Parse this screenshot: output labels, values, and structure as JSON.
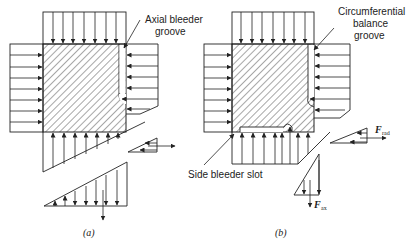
{
  "figure": {
    "panel_a": {
      "caption": "(a)",
      "labels": {
        "groove": [
          "Axial bleeder",
          "groove"
        ]
      }
    },
    "panel_b": {
      "caption": "(b)",
      "labels": {
        "groove": [
          "Circumferential",
          "balance",
          "groove"
        ],
        "slot": "Side bleeder slot",
        "f_rad": "F",
        "f_rad_sub": "rad",
        "f_ax": "F",
        "f_ax_sub": "ax"
      }
    }
  }
}
